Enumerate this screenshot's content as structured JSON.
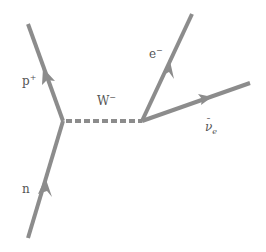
{
  "diagram": {
    "colors": {
      "line": "#8c8c8c",
      "text": "#555555",
      "background": "#ffffff"
    },
    "vertices": [
      {
        "id": "left-vertex",
        "x": 63,
        "y": 121
      },
      {
        "id": "right-vertex",
        "x": 142,
        "y": 121
      }
    ],
    "particles": [
      {
        "id": "neutron",
        "label": "n",
        "type": "fermion",
        "from": [
          28,
          238
        ],
        "to": [
          63,
          121
        ],
        "label_pos": [
          22,
          183
        ]
      },
      {
        "id": "proton",
        "label": "p",
        "superscript": "+",
        "type": "fermion",
        "from": [
          63,
          121
        ],
        "to": [
          28,
          24
        ],
        "label_pos": [
          22,
          75
        ]
      },
      {
        "id": "w-boson",
        "label": "W",
        "superscript": "−",
        "type": "boson-dashed",
        "from": [
          63,
          121
        ],
        "to": [
          142,
          121
        ],
        "label_pos": [
          97,
          95
        ]
      },
      {
        "id": "electron",
        "label": "e",
        "superscript": "−",
        "type": "fermion",
        "from": [
          142,
          121
        ],
        "to": [
          192,
          14
        ],
        "label_pos": [
          149,
          48
        ]
      },
      {
        "id": "antineutrino",
        "label": "ν",
        "bar": "¯",
        "subscript": "e",
        "type": "fermion",
        "from": [
          142,
          121
        ],
        "to": [
          250,
          83
        ],
        "label_pos": [
          205,
          121
        ]
      }
    ]
  }
}
